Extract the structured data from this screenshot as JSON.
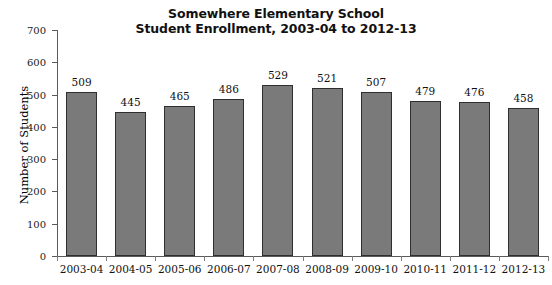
{
  "chart_data": {
    "type": "bar",
    "title": "Somewhere Elementary School",
    "subtitle": "Student Enrollment, 2003-04 to 2012-13",
    "xlabel": "",
    "ylabel": "Number of Students",
    "categories": [
      "2003-04",
      "2004-05",
      "2005-06",
      "2006-07",
      "2007-08",
      "2008-09",
      "2009-10",
      "2010-11",
      "2011-12",
      "2012-13"
    ],
    "values": [
      509,
      445,
      465,
      486,
      529,
      521,
      507,
      479,
      476,
      458
    ],
    "ylim": [
      0,
      700
    ],
    "ytick_step": 100,
    "yticks": [
      0,
      100,
      200,
      300,
      400,
      500,
      600,
      700
    ],
    "ytick_labels": [
      "0",
      "100",
      "200",
      "300",
      "400",
      "500",
      "600",
      "700"
    ],
    "grid": false,
    "legend": false,
    "data_labels": true,
    "bar_fill_color": "#7a7a7a",
    "bar_border_color": "#2f2f2f",
    "axis_color": "#5a5a5a",
    "background_color": "#ffffff",
    "text_color": "#111111"
  }
}
